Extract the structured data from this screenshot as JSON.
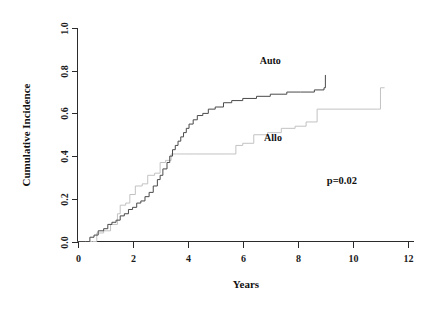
{
  "chart_data": {
    "type": "line",
    "title": "",
    "subtitle": "",
    "xlabel": "Years",
    "ylabel": "Cumulative Incidence",
    "xlim": [
      0,
      12
    ],
    "ylim": [
      0.0,
      1.0
    ],
    "grid": false,
    "legend_position": "inline-annotations",
    "x_ticks": [
      "0",
      "2",
      "4",
      "6",
      "8",
      "10",
      "12"
    ],
    "x_tick_values": [
      0,
      2,
      4,
      6,
      8,
      10,
      12
    ],
    "y_ticks": [
      "0.0",
      "0.2",
      "0.4",
      "0.6",
      "0.8",
      "1.0"
    ],
    "y_tick_values": [
      0.0,
      0.2,
      0.4,
      0.6,
      0.8,
      1.0
    ],
    "annotations": [
      {
        "name": "auto-label",
        "text": "Auto",
        "x": 7.0,
        "y": 0.83
      },
      {
        "name": "allo-label",
        "text": "Allo",
        "x": 7.1,
        "y": 0.47
      },
      {
        "name": "p-value",
        "text": "p=0.02",
        "x": 9.6,
        "y": 0.27
      }
    ],
    "series": [
      {
        "name": "Auto",
        "color": "#4a4a4a",
        "step": "post",
        "x": [
          0.0,
          0.3,
          0.45,
          0.6,
          0.75,
          0.95,
          1.1,
          1.25,
          1.4,
          1.55,
          1.7,
          1.85,
          2.0,
          2.15,
          2.3,
          2.45,
          2.6,
          2.75,
          2.9,
          3.0,
          3.1,
          3.25,
          3.35,
          3.45,
          3.55,
          3.65,
          3.75,
          3.85,
          3.95,
          4.05,
          4.2,
          4.35,
          4.55,
          4.75,
          5.0,
          5.3,
          5.6,
          6.0,
          6.5,
          7.0,
          7.6,
          8.1,
          8.6,
          8.95,
          9.0
        ],
        "y": [
          0.0,
          0.0,
          0.02,
          0.03,
          0.05,
          0.06,
          0.08,
          0.09,
          0.1,
          0.12,
          0.13,
          0.15,
          0.16,
          0.18,
          0.19,
          0.21,
          0.23,
          0.26,
          0.29,
          0.31,
          0.34,
          0.37,
          0.4,
          0.43,
          0.45,
          0.47,
          0.49,
          0.51,
          0.53,
          0.55,
          0.57,
          0.59,
          0.6,
          0.62,
          0.63,
          0.65,
          0.66,
          0.67,
          0.68,
          0.69,
          0.7,
          0.7,
          0.71,
          0.72,
          0.78
        ]
      },
      {
        "name": "Allo",
        "color": "#c2c2c2",
        "step": "post",
        "x": [
          0.0,
          0.55,
          0.7,
          0.95,
          1.2,
          1.45,
          1.55,
          1.75,
          1.9,
          2.1,
          2.35,
          2.55,
          2.8,
          3.0,
          3.2,
          3.4,
          3.6,
          3.9,
          4.2,
          5.5,
          5.75,
          6.0,
          6.4,
          6.9,
          7.4,
          7.9,
          8.3,
          8.7,
          10.9,
          11.0,
          11.15
        ],
        "y": [
          0.0,
          0.0,
          0.04,
          0.05,
          0.08,
          0.13,
          0.17,
          0.18,
          0.22,
          0.26,
          0.27,
          0.31,
          0.32,
          0.37,
          0.38,
          0.41,
          0.41,
          0.41,
          0.41,
          0.41,
          0.45,
          0.46,
          0.5,
          0.51,
          0.53,
          0.54,
          0.56,
          0.62,
          0.62,
          0.72,
          0.72
        ]
      }
    ]
  },
  "colors": {
    "auto_series": "#4a4a4a",
    "allo_series": "#c2c2c2",
    "axis": "#2b2b2b",
    "text": "#111111",
    "background": "#ffffff"
  }
}
